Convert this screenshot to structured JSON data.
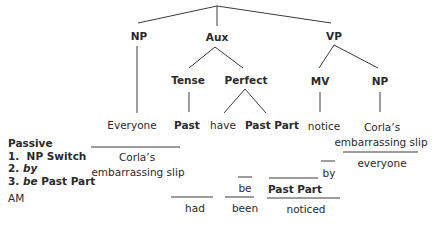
{
  "tree": {
    "root_children": [
      "NP",
      "Aux",
      "VP"
    ],
    "nodes": {
      "np": "NP",
      "aux": "Aux",
      "vp": "VP",
      "tense": "Tense",
      "perfect": "Perfect",
      "mv": "MV",
      "np2": "NP"
    },
    "leaves": {
      "everyone_subject": "Everyone",
      "past": "Past",
      "have": "have",
      "past_part": "Past Part",
      "notice": "notice",
      "corlas": "Corla’s",
      "embarrassing_slip": "embarrassing slip"
    }
  },
  "transform": {
    "subject_corlas": "Corla’s",
    "subject_embarrassing_slip": "embarrassing slip",
    "object_everyone": "everyone",
    "by": "by",
    "be": "be",
    "had": "had",
    "been": "been",
    "past_part": "Past Part",
    "noticed": "noticed"
  },
  "legend": {
    "title": "Passive",
    "steps": [
      {
        "num": "1.",
        "text": "NP Switch"
      },
      {
        "num": "2.",
        "text": "by"
      },
      {
        "num": "3.",
        "text_italic": "be",
        "text": "Past Part"
      }
    ],
    "footer": "AM"
  }
}
